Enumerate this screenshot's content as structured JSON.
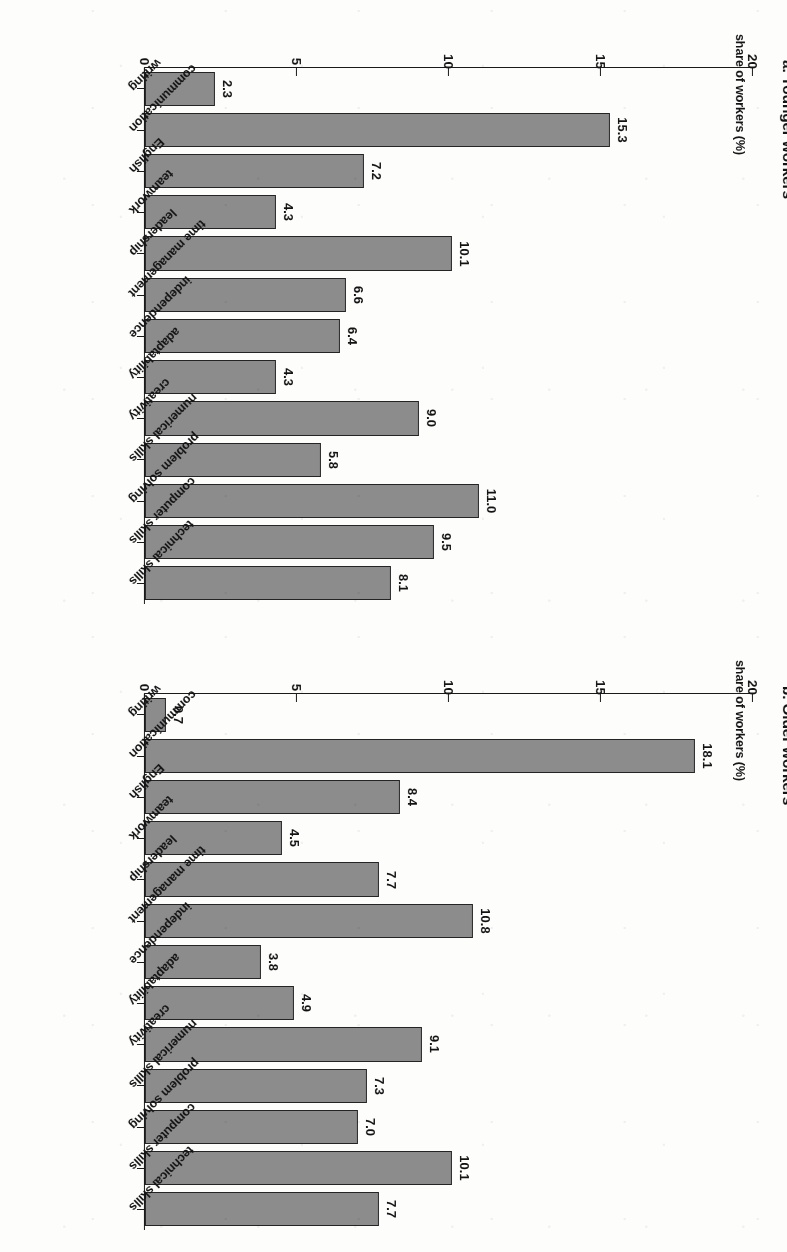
{
  "figure": {
    "background_color": "#fdfdfc",
    "bar_fill_color": "#8c8c8c",
    "bar_border_color": "#242424",
    "axis_color": "#1a1a1a",
    "text_color": "#141414"
  },
  "panels": {
    "older": {
      "title": "b. Older workers",
      "axis_title": "share of workers (%)"
    },
    "younger": {
      "title": "a. Younger workers",
      "axis_title": "share of workers (%)"
    }
  },
  "axis": {
    "tick_labels": [
      "0",
      "5",
      "10",
      "15",
      "20"
    ],
    "tick_values": [
      0,
      5,
      10,
      15,
      20
    ]
  },
  "chart_data": [
    {
      "type": "bar",
      "title": "b. Older workers",
      "panel_letter": "b",
      "orientation": "horizontal",
      "xlabel": "",
      "ylabel": "share of workers (%)",
      "ylim": [
        0,
        20
      ],
      "yticks": [
        0,
        5,
        10,
        15,
        20
      ],
      "grid": false,
      "legend": "none",
      "categories": [
        "writing",
        "communication",
        "English",
        "teamwork",
        "leadership",
        "time management",
        "independence",
        "adaptability",
        "creativity",
        "numerical skills",
        "problem solving",
        "computer skills",
        "technical skills"
      ],
      "values": [
        0.7,
        18.1,
        8.4,
        4.5,
        7.7,
        10.8,
        3.8,
        4.9,
        9.1,
        7.3,
        7.0,
        10.1,
        7.7
      ],
      "value_labels": [
        "0.7",
        "18.1",
        "8.4",
        "4.5",
        "7.7",
        "10.8",
        "3.8",
        "4.9",
        "9.1",
        "7.3",
        "7.0",
        "10.1",
        "7.7"
      ]
    },
    {
      "type": "bar",
      "title": "a. Younger workers",
      "panel_letter": "a",
      "orientation": "horizontal",
      "xlabel": "",
      "ylabel": "share of workers (%)",
      "ylim": [
        0,
        20
      ],
      "yticks": [
        0,
        5,
        10,
        15,
        20
      ],
      "grid": false,
      "legend": "none",
      "categories": [
        "writing",
        "communication",
        "English",
        "teamwork",
        "leadership",
        "time management",
        "independence",
        "adaptability",
        "creativity",
        "numerical skills",
        "problem solving",
        "computer skills",
        "technical skills"
      ],
      "values": [
        2.3,
        15.3,
        7.2,
        4.3,
        10.1,
        6.6,
        6.4,
        4.3,
        9.0,
        5.8,
        11.0,
        9.5,
        8.1
      ],
      "value_labels": [
        "2.3",
        "15.3",
        "7.2",
        "4.3",
        "10.1",
        "6.6",
        "6.4",
        "4.3",
        "9.0",
        "5.8",
        "11.0",
        "9.5",
        "8.1"
      ]
    }
  ]
}
